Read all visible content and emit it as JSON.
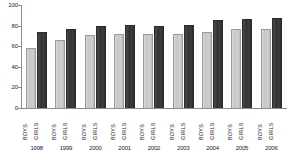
{
  "chart_data": {
    "type": "bar",
    "title": "",
    "xlabel": "",
    "ylabel": "",
    "ylim": [
      0,
      100
    ],
    "yticks": [
      0,
      20,
      40,
      60,
      80,
      100
    ],
    "grid": false,
    "legend_position": "none",
    "categories": [
      "1998",
      "1999",
      "2000",
      "2001",
      "2002",
      "2003",
      "2004",
      "2005",
      "2006"
    ],
    "series": [
      {
        "name": "BOYS",
        "color": "#c8c8c8",
        "values": [
          58,
          66,
          71,
          72,
          72,
          72,
          74,
          77,
          77
        ]
      },
      {
        "name": "GIRLS",
        "color": "#353535",
        "values": [
          74,
          77,
          80,
          81,
          80,
          81,
          85,
          86,
          87
        ]
      }
    ]
  },
  "axis": {
    "y_tick_labels": [
      "100",
      "80",
      "60",
      "40",
      "20",
      "0"
    ]
  }
}
